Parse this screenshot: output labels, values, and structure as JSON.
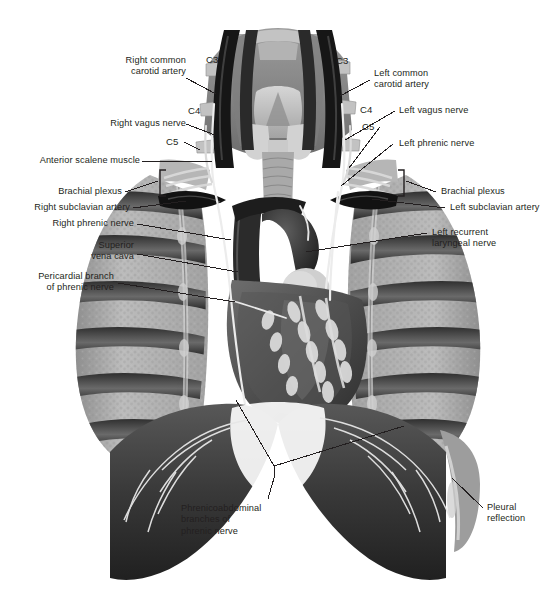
{
  "figure": {
    "style": "grayscale medical illustration",
    "background": "#ffffff",
    "text_color": "#231f20",
    "leader_color": "#231f20",
    "width": 555,
    "height": 608
  },
  "labels": {
    "right_common_carotid_artery": "Right common\ncarotid artery",
    "left_common_carotid_artery": "Left common\ncarotid artery",
    "right_vagus_nerve": "Right vagus nerve",
    "left_vagus_nerve": "Left vagus nerve",
    "anterior_scalene_muscle": "Anterior scalene muscle",
    "left_phrenic_nerve": "Left phrenic nerve",
    "brachial_plexus_right": "Brachial plexus",
    "brachial_plexus_left": "Brachial plexus",
    "right_subclavian_artery": "Right subclavian artery",
    "left_subclavian_artery": "Left subclavian artery",
    "right_phrenic_nerve": "Right phrenic nerve",
    "superior_vena_cava": "Superior\nvena cava",
    "left_recurrent_laryngeal_nerve": "Left recurrent\nlaryngeal nerve",
    "pericardial_branch_of_phrenic_nerve": "Pericardial branch\nof phrenic nerve",
    "phrenicoabdominal_branches": "Phrenicoabdominal\nbranches of\nphrenic nerve",
    "pleural_reflection": "Pleural\nreflection"
  },
  "segments": {
    "c3_right": "C3",
    "c4_right": "C4",
    "c5_right": "C5",
    "c3_left": "C3",
    "c4_left": "C4",
    "c5_left": "C5"
  },
  "palette": {
    "ink": "#231f20",
    "lung_light": "#b9b9b9",
    "lung_mid": "#9a9a9a",
    "rib_dark": "#3a3a3a",
    "rib_mid": "#6e6e6e",
    "vessel_dark": "#1b1b1b",
    "heart_dark": "#4a4a4a",
    "heart_mid": "#6a6a6a",
    "diaphragm": "#3c3c3c",
    "nerve_pale": "#e2e2e2",
    "thyroid": "#c9c9c9",
    "trachea": "#aeaeae"
  }
}
